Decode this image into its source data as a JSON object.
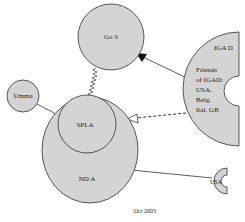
{
  "diagram": {
    "colors": {
      "fill": "#d4d4d4",
      "stroke": "#333333",
      "background": "#ffffff"
    },
    "nodes": {
      "gos": {
        "label": "Go S",
        "shape": "circle"
      },
      "umma": {
        "label": "Umma",
        "shape": "circle"
      },
      "nda": {
        "label": "ND A",
        "shape": "ellipse"
      },
      "spla": {
        "label": "SPLA",
        "shape": "circle"
      },
      "igad": {
        "label": "IGA D",
        "shape": "half-disc",
        "sublines": [
          "Friends",
          "of IGAD:",
          "USA,",
          "Belg.",
          "Ital. GB"
        ]
      },
      "usa": {
        "label": "USA",
        "shape": "crescent"
      }
    },
    "edges": [
      {
        "from": "igad",
        "to": "gos",
        "style": "solid",
        "head": "filled-triangle"
      },
      {
        "from": "igad",
        "to": "spla",
        "style": "dashed",
        "head": "open-triangle"
      },
      {
        "from": "gos",
        "to": "spla",
        "style": "zigzag",
        "head": "none"
      },
      {
        "from": "umma",
        "to": "nda",
        "style": "solid",
        "head": "none"
      },
      {
        "from": "nda",
        "to": "usa",
        "style": "solid",
        "head": "none"
      }
    ],
    "caption": "Oct 2003"
  }
}
